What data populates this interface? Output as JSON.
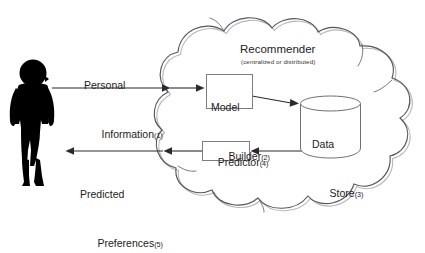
{
  "diagram": {
    "actor": {
      "name": "person-silhouette"
    },
    "cloud": {
      "label": "Recommender",
      "sublabel": "(centralized or distributed)"
    },
    "flows": [
      {
        "id": "1",
        "line1": "Personal",
        "line2": "Information",
        "index": "(1)",
        "direction": "right"
      },
      {
        "id": "5",
        "line1": "Predicted",
        "line2": "Preferences",
        "index": "(5)",
        "direction": "left"
      }
    ],
    "nodes": [
      {
        "id": "2",
        "line1": "Model",
        "line2": "Builder",
        "index": "(2)",
        "shape": "rectangle"
      },
      {
        "id": "3",
        "line1": "Data",
        "line2": "Store",
        "index": "(3)",
        "shape": "cylinder"
      },
      {
        "id": "4",
        "line1": "Predictor",
        "line2": "",
        "index": "(4)",
        "shape": "rectangle"
      }
    ],
    "colors": {
      "ink": "#1a1a1a",
      "silhouette": "#000000",
      "cloud_stroke": "#5a5a62",
      "cloud_stroke_light": "#a9a9b0",
      "box_stroke": "#7d7d84",
      "arrow": "#2b2b2b",
      "background": "#ffffff"
    }
  }
}
